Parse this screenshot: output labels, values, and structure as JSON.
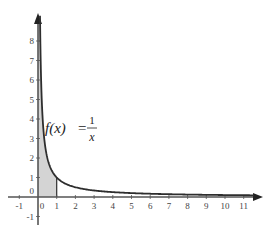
{
  "chart_data": {
    "type": "line",
    "title": "",
    "xlabel": "",
    "ylabel": "",
    "function": "f(x) = 1/x",
    "annotation": {
      "lhs": "f(x)",
      "equals": "=",
      "numerator": "1",
      "denominator": "x",
      "position": {
        "x": 1.0,
        "y": 3.6
      }
    },
    "x_ticks": [
      -1,
      0,
      1,
      2,
      3,
      4,
      5,
      6,
      7,
      8,
      9,
      10,
      11
    ],
    "y_ticks": [
      -1,
      0,
      1,
      2,
      3,
      4,
      5,
      6,
      7,
      8
    ],
    "xlim": [
      -1.3,
      11.9
    ],
    "ylim": [
      -1.3,
      9.2
    ],
    "shaded_region": {
      "x_from": 0,
      "x_to": 1,
      "description": "area under curve from 0 to 1"
    },
    "series": [
      {
        "name": "f(x)=1/x",
        "x": [
          0.111,
          0.125,
          0.15,
          0.2,
          0.25,
          0.33,
          0.5,
          0.75,
          1,
          1.5,
          2,
          3,
          4,
          5,
          6,
          7,
          8,
          9,
          10,
          11,
          11.5
        ],
        "values": [
          9,
          8,
          6.67,
          5,
          4,
          3,
          2,
          1.33,
          1,
          0.67,
          0.5,
          0.33,
          0.25,
          0.2,
          0.17,
          0.14,
          0.125,
          0.11,
          0.1,
          0.09,
          0.087
        ]
      }
    ],
    "grid": false,
    "legend": null
  },
  "colors": {
    "curve": "#2e2e2e",
    "axis": "#555555",
    "shade": "#d4d4d4",
    "text": "#444444"
  }
}
